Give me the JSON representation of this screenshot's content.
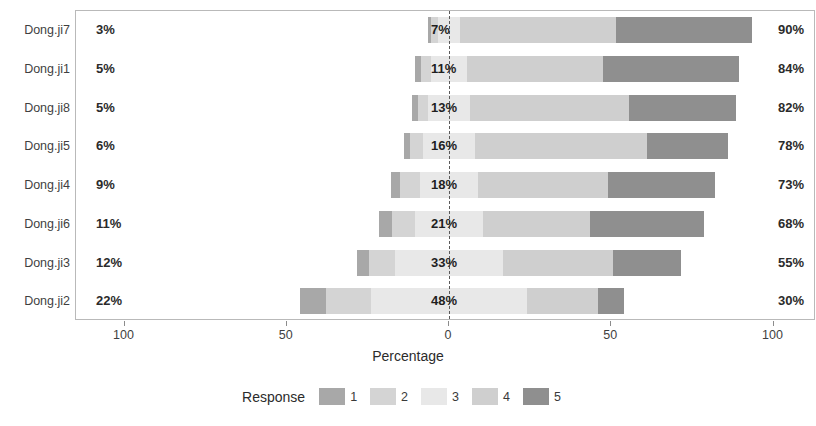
{
  "chart_data": {
    "type": "bar",
    "subtype": "diverging-stacked-likert",
    "title": "",
    "xlabel": "Percentage",
    "ylabel": "",
    "xlim": [
      -100,
      100
    ],
    "xticks": [
      -100,
      -50,
      0,
      50,
      100
    ],
    "xticklabels": [
      "100",
      "50",
      "0",
      "50",
      "100"
    ],
    "grid": false,
    "legend_title": "Response",
    "legend_position": "bottom",
    "categories": [
      "Dong.ji7",
      "Dong.ji1",
      "Dong.ji8",
      "Dong.ji5",
      "Dong.ji4",
      "Dong.ji6",
      "Dong.ji3",
      "Dong.ji2"
    ],
    "response_levels": [
      "1",
      "2",
      "3",
      "4",
      "5"
    ],
    "colors": {
      "1": "#a8a8a8",
      "2": "#d4d4d4",
      "3": "#e8e8e8",
      "4": "#cfcfcf",
      "5": "#8f8f8f",
      "axis": "#b9b9b9",
      "text": "#3a3a3a",
      "zero_line": "#5a5a5a",
      "background": "#ffffff"
    },
    "series": [
      {
        "name": "1",
        "values": [
          1,
          2,
          2,
          2,
          3,
          4,
          4,
          8
        ]
      },
      {
        "name": "2",
        "values": [
          2,
          3,
          3,
          4,
          6,
          7,
          8,
          14
        ]
      },
      {
        "name": "3",
        "values": [
          7,
          11,
          13,
          16,
          18,
          21,
          33,
          48
        ]
      },
      {
        "name": "4",
        "values": [
          48,
          42,
          49,
          53,
          40,
          33,
          34,
          22
        ]
      },
      {
        "name": "5",
        "values": [
          42,
          42,
          33,
          25,
          33,
          35,
          21,
          8
        ]
      }
    ],
    "rows": [
      {
        "label": "Dong.ji7",
        "left_label": "3%",
        "mid_label": "7%",
        "right_label": "90%",
        "left_total": 3,
        "mid": 7,
        "right_total": 90,
        "seg1": 1,
        "seg2": 2,
        "seg3": 7,
        "seg4": 48,
        "seg5": 42
      },
      {
        "label": "Dong.ji1",
        "left_label": "5%",
        "mid_label": "11%",
        "right_label": "84%",
        "left_total": 5,
        "mid": 11,
        "right_total": 84,
        "seg1": 2,
        "seg2": 3,
        "seg3": 11,
        "seg4": 42,
        "seg5": 42
      },
      {
        "label": "Dong.ji8",
        "left_label": "5%",
        "mid_label": "13%",
        "right_label": "82%",
        "left_total": 5,
        "mid": 13,
        "right_total": 82,
        "seg1": 2,
        "seg2": 3,
        "seg3": 13,
        "seg4": 49,
        "seg5": 33
      },
      {
        "label": "Dong.ji5",
        "left_label": "6%",
        "mid_label": "16%",
        "right_label": "78%",
        "left_total": 6,
        "mid": 16,
        "right_total": 78,
        "seg1": 2,
        "seg2": 4,
        "seg3": 16,
        "seg4": 53,
        "seg5": 25
      },
      {
        "label": "Dong.ji4",
        "left_label": "9%",
        "mid_label": "18%",
        "right_label": "73%",
        "left_total": 9,
        "mid": 18,
        "right_total": 73,
        "seg1": 3,
        "seg2": 6,
        "seg3": 18,
        "seg4": 40,
        "seg5": 33
      },
      {
        "label": "Dong.ji6",
        "left_label": "11%",
        "mid_label": "21%",
        "right_label": "68%",
        "left_total": 11,
        "mid": 21,
        "right_total": 68,
        "seg1": 4,
        "seg2": 7,
        "seg3": 21,
        "seg4": 33,
        "seg5": 35
      },
      {
        "label": "Dong.ji3",
        "left_label": "12%",
        "mid_label": "33%",
        "right_label": "55%",
        "left_total": 12,
        "mid": 33,
        "right_total": 55,
        "seg1": 4,
        "seg2": 8,
        "seg3": 33,
        "seg4": 34,
        "seg5": 21
      },
      {
        "label": "Dong.ji2",
        "left_label": "22%",
        "mid_label": "48%",
        "right_label": "30%",
        "left_total": 22,
        "mid": 48,
        "right_total": 30,
        "seg1": 8,
        "seg2": 14,
        "seg3": 48,
        "seg4": 22,
        "seg5": 8
      }
    ],
    "legend_items": [
      {
        "label": "1",
        "color": "#a8a8a8"
      },
      {
        "label": "2",
        "color": "#d4d4d4"
      },
      {
        "label": "3",
        "color": "#e8e8e8"
      },
      {
        "label": "4",
        "color": "#cfcfcf"
      },
      {
        "label": "5",
        "color": "#8f8f8f"
      }
    ]
  }
}
